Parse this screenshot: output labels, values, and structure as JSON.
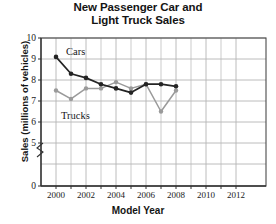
{
  "chart_data": {
    "type": "line",
    "title": "New Passenger Car and Light Truck Sales",
    "title_line1": "New Passenger Car and",
    "title_line2": "Light Truck Sales",
    "xlabel": "Model Year",
    "ylabel": "Sales (millions of vehicles)",
    "x": [
      2000,
      2001,
      2002,
      2003,
      2004,
      2005,
      2006,
      2007,
      2008
    ],
    "xlim": [
      1999,
      2013
    ],
    "ylim": [
      5,
      10
    ],
    "y_axis_break": true,
    "y_break_between": [
      0,
      5
    ],
    "yticks": [
      0,
      5,
      6,
      7,
      8,
      9,
      10
    ],
    "xticks": [
      2000,
      2002,
      2004,
      2006,
      2008,
      2010,
      2012
    ],
    "xticks_minor": [
      2001,
      2003,
      2005,
      2007,
      2009,
      2011
    ],
    "grid": true,
    "legend_position": "inline-annotations",
    "series": [
      {
        "name": "Cars",
        "color": "#242424",
        "marker": "circle",
        "values": [
          9.1,
          8.3,
          8.1,
          7.8,
          7.6,
          7.4,
          7.8,
          7.8,
          7.7
        ]
      },
      {
        "name": "Trucks",
        "color": "#9a9a9a",
        "marker": "circle",
        "values": [
          7.5,
          7.1,
          7.6,
          7.6,
          7.9,
          7.6,
          7.8,
          6.5,
          7.5
        ]
      }
    ],
    "annotations": [
      {
        "text": "Cars",
        "x": 2000.8,
        "y": 9.45
      },
      {
        "text": "Trucks",
        "x": 2000.5,
        "y": 6.55
      }
    ]
  },
  "axis": {
    "ytick_labels": [
      "10",
      "9",
      "8",
      "7",
      "6",
      "5",
      "0"
    ],
    "xtick_labels": [
      "2000",
      "2002",
      "2004",
      "2006",
      "2008",
      "2010",
      "2012"
    ]
  },
  "colors": {
    "cars": "#242424",
    "trucks": "#9a9a9a",
    "grid": "#b4b4b4",
    "frame": "#4a4a4a",
    "text": "#141414"
  }
}
